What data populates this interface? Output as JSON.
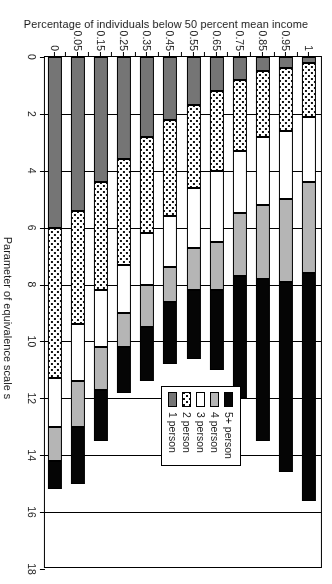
{
  "chart_data": {
    "type": "bar",
    "orientation": "vertical-stacked",
    "title": "",
    "xlabel": "Parameter of equivalence scale s",
    "ylabel": "Percentage of individuals below 50 percent mean income",
    "categories": [
      "0",
      "0.05",
      "0.15",
      "0.25",
      "0.35",
      "0.45",
      "0.55",
      "0.65",
      "0.75",
      "0.85",
      "0.95",
      "1"
    ],
    "ylim": [
      0,
      18
    ],
    "yticks": [
      "0",
      "2",
      "4",
      "6",
      "8",
      "10",
      "12",
      "14",
      "16",
      "18"
    ],
    "grid": true,
    "legend_position": "upper-left",
    "series": [
      {
        "name": "1 person",
        "color": "#757575",
        "pattern": "solid",
        "values": [
          6.0,
          5.4,
          4.4,
          3.6,
          2.8,
          2.2,
          1.7,
          1.2,
          0.8,
          0.5,
          0.4,
          0.2
        ]
      },
      {
        "name": "2 person",
        "color": "#ffffff",
        "pattern": "dotted",
        "values": [
          5.3,
          4.0,
          3.8,
          3.7,
          3.4,
          3.4,
          2.9,
          2.8,
          2.5,
          2.3,
          2.2,
          1.9
        ]
      },
      {
        "name": "3 person",
        "color": "#ffffff",
        "pattern": "solid",
        "values": [
          1.7,
          2.0,
          2.0,
          1.7,
          1.8,
          1.8,
          2.1,
          2.5,
          2.2,
          2.4,
          2.4,
          2.3
        ]
      },
      {
        "name": "4 person",
        "color": "#b5b5b5",
        "pattern": "solid",
        "values": [
          1.2,
          1.6,
          1.5,
          1.2,
          1.5,
          1.2,
          1.5,
          1.7,
          2.2,
          2.6,
          2.9,
          3.2
        ]
      },
      {
        "name": "5+ person",
        "color": "#050505",
        "pattern": "solid",
        "values": [
          1.0,
          2.0,
          1.8,
          1.6,
          1.9,
          2.2,
          2.4,
          2.8,
          4.3,
          5.7,
          6.7,
          8.0
        ]
      }
    ],
    "cumulative_tops": {
      "1 person": [
        6.0,
        5.4,
        4.4,
        3.6,
        2.8,
        2.2,
        1.7,
        1.2,
        0.8,
        0.5,
        0.4,
        0.2
      ],
      "2 person": [
        11.3,
        9.4,
        8.2,
        7.3,
        6.2,
        5.6,
        4.6,
        4.0,
        3.3,
        2.8,
        2.6,
        2.1
      ],
      "3 person": [
        13.0,
        11.4,
        10.2,
        9.0,
        8.0,
        7.4,
        6.7,
        6.5,
        5.5,
        5.2,
        5.0,
        4.4
      ],
      "4 person": [
        14.2,
        13.0,
        11.7,
        10.2,
        9.5,
        8.6,
        8.2,
        8.2,
        7.7,
        7.8,
        7.9,
        7.6
      ],
      "5+ person": [
        15.2,
        15.0,
        13.5,
        11.8,
        11.4,
        10.8,
        10.6,
        11.0,
        12.0,
        13.5,
        14.6,
        15.6
      ]
    }
  },
  "legend": {
    "items": [
      {
        "label": "5+ person"
      },
      {
        "label": "4 person"
      },
      {
        "label": "3 person"
      },
      {
        "label": "2 person"
      },
      {
        "label": "1 person"
      }
    ]
  }
}
